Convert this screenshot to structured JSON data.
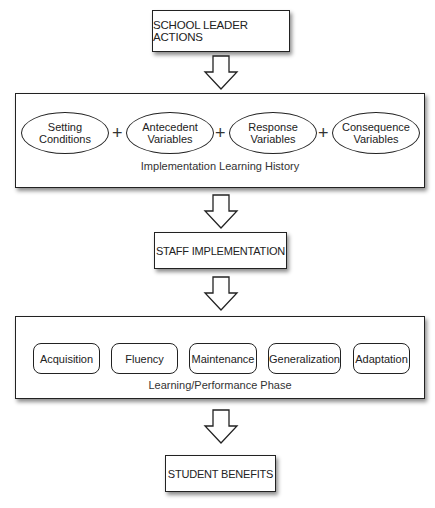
{
  "diagram": {
    "type": "flowchart",
    "nodes": {
      "school_leader_actions": "SCHOOL LEADER ACTIONS",
      "staff_implementation": "STAFF IMPLEMENTATION",
      "student_benefits": "STUDENT BENEFITS"
    },
    "learning_history": {
      "caption": "Implementation Learning History",
      "items": [
        {
          "line1": "Setting",
          "line2": "Conditions"
        },
        {
          "line1": "Antecedent",
          "line2": "Variables"
        },
        {
          "line1": "Response",
          "line2": "Variables"
        },
        {
          "line1": "Consequence",
          "line2": "Variables"
        }
      ],
      "operator": "+"
    },
    "performance_phase": {
      "caption": "Learning/Performance Phase",
      "items": [
        "Acquisition",
        "Fluency",
        "Maintenance",
        "Generalization",
        "Adaptation"
      ]
    },
    "arrows": [
      "down-arrow",
      "down-arrow",
      "down-arrow",
      "down-arrow"
    ]
  }
}
